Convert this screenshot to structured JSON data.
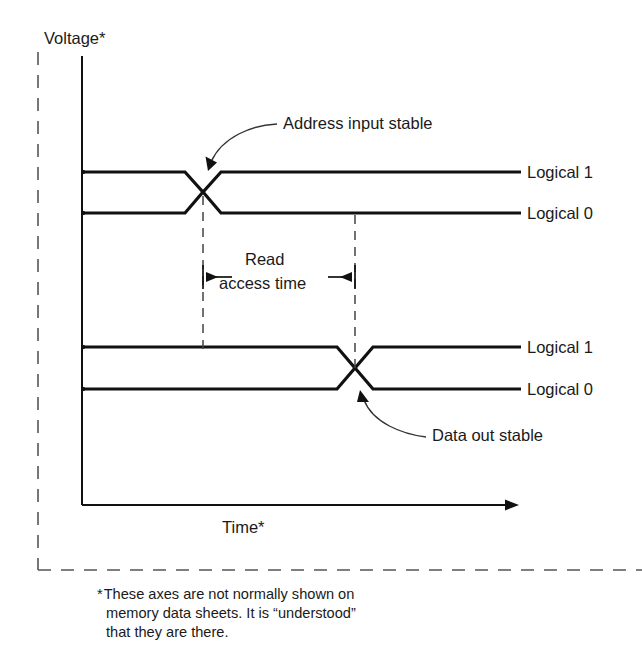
{
  "figure": {
    "kind": "timing-diagram",
    "title_internal": "Memory read timing diagram",
    "background_color": "#ffffff",
    "line_color": "#111111",
    "dashed_color": "#555555"
  },
  "axes": {
    "y_label": "Voltage*",
    "x_label": "Time*",
    "y_axis_x": 82,
    "x_axis_y": 505,
    "x_axis_end": 513
  },
  "waveforms": [
    {
      "name": "address-input",
      "high_label": "Logical 1",
      "low_label": "Logical 0",
      "high_y": 172,
      "low_y": 213,
      "transition_x": 203
    },
    {
      "name": "data-out",
      "high_label": "Logical 1",
      "low_label": "Logical 0",
      "high_y": 347,
      "low_y": 389,
      "transition_x": 355
    }
  ],
  "callouts": [
    {
      "name": "address-input-stable",
      "text": "Address input stable",
      "text_x": 285,
      "text_y": 129,
      "target_x": 210,
      "target_y": 166
    },
    {
      "name": "data-out-stable",
      "text": "Data out stable",
      "text_x": 432,
      "text_y": 441,
      "target_x": 362,
      "target_y": 394
    }
  ],
  "measurement": {
    "name": "read-access-time",
    "label_line1": "Read",
    "label_line2": "access time",
    "start_x": 203,
    "end_x": 355,
    "arrow_y": 277,
    "guide_top": 215,
    "guide_bottom": 345
  },
  "footnote": {
    "marker": "*",
    "line1": "These axes are not normally shown on",
    "line2": "memory data sheets.  It is “understood”",
    "line3": "that they are there.",
    "x": 96,
    "y": 595
  },
  "boundary": {
    "name": "figure-boundary",
    "left_x": 38,
    "top_y": 50,
    "bottom_y": 570,
    "right_x": 642
  }
}
